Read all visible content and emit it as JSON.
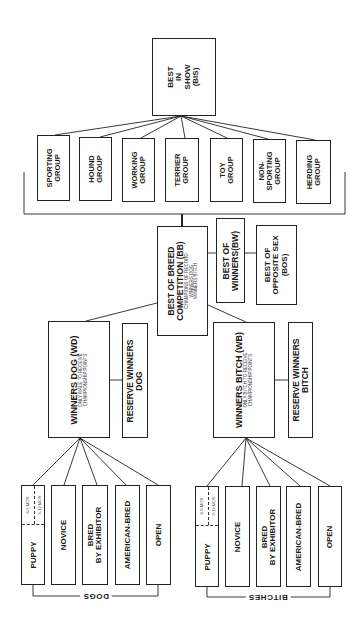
{
  "diagram": {
    "orientation": "rotated -90deg (text reads bottom-to-top)",
    "best_in_show": {
      "lines": [
        "BEST",
        "IN",
        "SHOW",
        "(BIS)"
      ]
    },
    "groups": [
      {
        "lines": [
          "SPORTING",
          "GROUP"
        ]
      },
      {
        "lines": [
          "HOUND",
          "GROUP"
        ]
      },
      {
        "lines": [
          "WORKING",
          "GROUP"
        ]
      },
      {
        "lines": [
          "TERRIER",
          "GROUP"
        ]
      },
      {
        "lines": [
          "TOY",
          "GROUP"
        ]
      },
      {
        "lines": [
          "NON-",
          "SPORTING",
          "GROUP"
        ]
      },
      {
        "lines": [
          "HERDING",
          "GROUP"
        ]
      }
    ],
    "best_of_breed": {
      "lines": [
        "BEST OF BREED",
        "COMPETITION (BB)"
      ],
      "sub": [
        "CHAMPIONS OF RECORD",
        "WINNERS DOG",
        "WINNERS BITCH"
      ]
    },
    "best_of_winners": {
      "lines": [
        "BEST OF",
        "WINNERS(BW)"
      ]
    },
    "best_opposite_sex": {
      "lines": [
        "BEST OF",
        "OPPOSITE SEX",
        "(BOS)"
      ]
    },
    "winners_dog": {
      "lines": [
        "WINNERS DOG (WD)"
      ],
      "sub": [
        "ONLY MALE TO RECEIVE",
        "CHAMPIONSHIP POINTS"
      ]
    },
    "reserve_winners_dog": {
      "lines": [
        "RESERVE WINNERS",
        "DOG"
      ]
    },
    "winners_bitch": {
      "lines": [
        "WINNERS BITCH (WB)"
      ],
      "sub": [
        "ONLY BITCH TO RECEIVE",
        "CHAMPIONSHIP POINTS"
      ]
    },
    "reserve_winners_bitch": {
      "lines": [
        "RESERVE WINNERS",
        "BITCH"
      ]
    },
    "dog_classes": {
      "bracket_label": "DOGS",
      "classes": [
        {
          "lines": [
            "PUPPY"
          ],
          "sub": [
            "6-9 MOS",
            "9-12 MOS"
          ]
        },
        {
          "lines": [
            "NOVICE"
          ]
        },
        {
          "lines": [
            "BRED",
            "BY EXHIBITOR"
          ]
        },
        {
          "lines": [
            "AMERICAN-BRED"
          ]
        },
        {
          "lines": [
            "OPEN"
          ]
        }
      ]
    },
    "bitch_classes": {
      "bracket_label": "BITCHES",
      "classes": [
        {
          "lines": [
            "PUPPY"
          ],
          "sub": [
            "6-9 MOS",
            "9-12 MOS"
          ]
        },
        {
          "lines": [
            "NOVICE"
          ]
        },
        {
          "lines": [
            "BRED",
            "BY EXHIBITOR"
          ]
        },
        {
          "lines": [
            "AMERICAN-BRED"
          ]
        },
        {
          "lines": [
            "OPEN"
          ]
        }
      ]
    },
    "colors": {
      "line": "#222222",
      "background": "#ffffff",
      "text": "#1a1a1a"
    }
  }
}
